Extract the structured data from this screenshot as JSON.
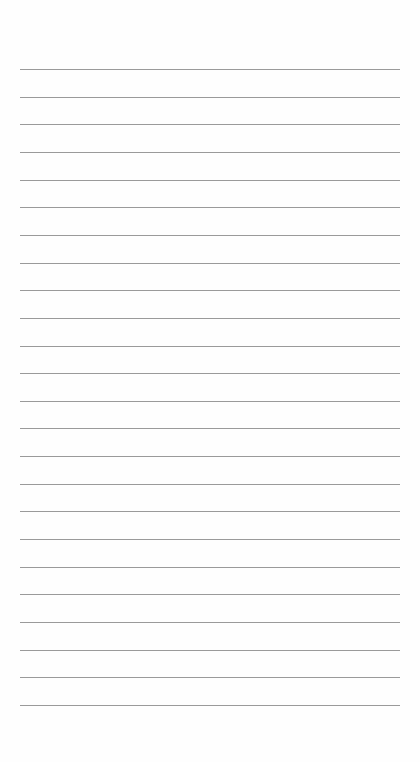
{
  "page": {
    "type": "lined-notepad",
    "background_color": "#fefefe",
    "line_color": "#9a9a9a",
    "line_count": 24,
    "first_line_y": 69,
    "line_spacing": 27.65,
    "line_left": 20,
    "line_width": 380,
    "lines": [
      {
        "text": ""
      },
      {
        "text": ""
      },
      {
        "text": ""
      },
      {
        "text": ""
      },
      {
        "text": ""
      },
      {
        "text": ""
      },
      {
        "text": ""
      },
      {
        "text": ""
      },
      {
        "text": ""
      },
      {
        "text": ""
      },
      {
        "text": ""
      },
      {
        "text": ""
      },
      {
        "text": ""
      },
      {
        "text": ""
      },
      {
        "text": ""
      },
      {
        "text": ""
      },
      {
        "text": ""
      },
      {
        "text": ""
      },
      {
        "text": ""
      },
      {
        "text": ""
      },
      {
        "text": ""
      },
      {
        "text": ""
      },
      {
        "text": ""
      },
      {
        "text": ""
      }
    ]
  }
}
